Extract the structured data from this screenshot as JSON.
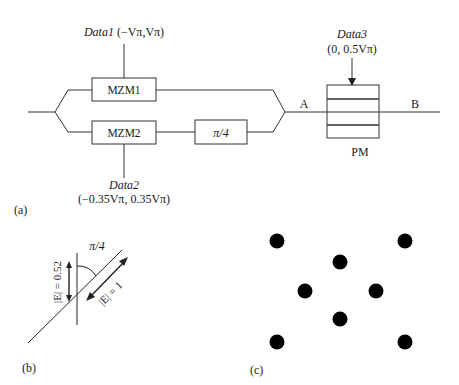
{
  "panel_a": {
    "label": "(a)",
    "data1": {
      "name": "Data1",
      "range": "(−Vπ,Vπ)"
    },
    "data2": {
      "name": "Data2",
      "range": "(−0.35Vπ, 0.35Vπ)"
    },
    "data3": {
      "name": "Data3",
      "range": "(0, 0.5Vπ)"
    },
    "mzm1": "MZM1",
    "mzm2": "MZM2",
    "phase_shift": "π/4",
    "pm": "PM",
    "point_a": "A",
    "point_b": "B"
  },
  "panel_b": {
    "label": "(b)",
    "angle": "π/4",
    "e_vertical": "|E| = 0.52",
    "e_diagonal": "|E| = 1"
  },
  "panel_c": {
    "label": "(c)",
    "constellation_points": [
      {
        "x": 277,
        "y": 241
      },
      {
        "x": 405,
        "y": 241
      },
      {
        "x": 340,
        "y": 262
      },
      {
        "x": 305,
        "y": 291
      },
      {
        "x": 376,
        "y": 291
      },
      {
        "x": 340,
        "y": 319
      },
      {
        "x": 277,
        "y": 342
      },
      {
        "x": 405,
        "y": 342
      }
    ]
  }
}
